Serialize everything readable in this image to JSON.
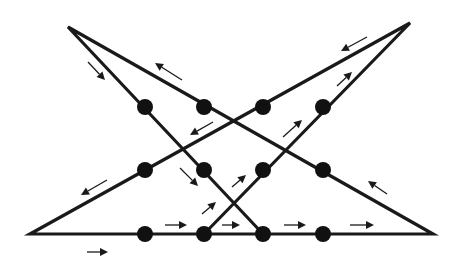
{
  "diagram": {
    "type": "nine-dot-style puzzle solution (12 dots, 5 connected straight lines)",
    "colors": {
      "background": "#ffffff",
      "line": "#1a1a1a",
      "dot": "#111111"
    },
    "dots": {
      "rows": 3,
      "cols": 4,
      "xs": [
        145,
        204,
        263,
        323
      ],
      "ys": [
        107,
        170,
        234
      ],
      "radius": 8
    },
    "path_vertices": [
      {
        "name": "start",
        "x": 204,
        "y": 234
      },
      {
        "name": "top-right-apex",
        "x": 410,
        "y": 23
      },
      {
        "name": "bottom-left-apex",
        "x": 30,
        "y": 234
      },
      {
        "name": "bottom-right-apex",
        "x": 433,
        "y": 234
      },
      {
        "name": "top-left-apex",
        "x": 68,
        "y": 27
      },
      {
        "name": "end",
        "x": 263,
        "y": 234
      }
    ],
    "segments": [
      {
        "from": [
          204,
          234
        ],
        "to": [
          410,
          23
        ]
      },
      {
        "from": [
          410,
          23
        ],
        "to": [
          30,
          234
        ]
      },
      {
        "from": [
          30,
          234
        ],
        "to": [
          433,
          234
        ]
      },
      {
        "from": [
          433,
          234
        ],
        "to": [
          68,
          27
        ]
      },
      {
        "from": [
          68,
          27
        ],
        "to": [
          263,
          234
        ]
      }
    ],
    "arrows": [
      {
        "x1": 87,
        "y1": 252,
        "x2": 108,
        "y2": 252,
        "dir": "right"
      },
      {
        "x1": 165,
        "y1": 225,
        "x2": 187,
        "y2": 225,
        "dir": "right"
      },
      {
        "x1": 222,
        "y1": 225,
        "x2": 240,
        "y2": 225,
        "dir": "right"
      },
      {
        "x1": 284,
        "y1": 225,
        "x2": 306,
        "y2": 225,
        "dir": "right"
      },
      {
        "x1": 350,
        "y1": 225,
        "x2": 374,
        "y2": 225,
        "dir": "right"
      },
      {
        "x1": 202,
        "y1": 214,
        "x2": 216,
        "y2": 202,
        "dir": "up-right"
      },
      {
        "x1": 232,
        "y1": 187,
        "x2": 246,
        "y2": 175,
        "dir": "up-right"
      },
      {
        "x1": 283,
        "y1": 137,
        "x2": 302,
        "y2": 120,
        "dir": "up-right"
      },
      {
        "x1": 337,
        "y1": 86,
        "x2": 352,
        "y2": 72,
        "dir": "up-right"
      },
      {
        "x1": 367,
        "y1": 37,
        "x2": 341,
        "y2": 51,
        "dir": "down-left"
      },
      {
        "x1": 213,
        "y1": 122,
        "x2": 190,
        "y2": 135,
        "dir": "down-left"
      },
      {
        "x1": 107,
        "y1": 180,
        "x2": 81,
        "y2": 195,
        "dir": "down-left"
      },
      {
        "x1": 387,
        "y1": 194,
        "x2": 368,
        "y2": 181,
        "dir": "up-left"
      },
      {
        "x1": 182,
        "y1": 80,
        "x2": 155,
        "y2": 63,
        "dir": "up-left"
      },
      {
        "x1": 88,
        "y1": 62,
        "x2": 105,
        "y2": 80,
        "dir": "down-right"
      },
      {
        "x1": 180,
        "y1": 168,
        "x2": 198,
        "y2": 186,
        "dir": "down-right"
      }
    ]
  }
}
